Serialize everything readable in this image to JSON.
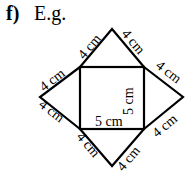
{
  "header": {
    "part_label": "f)",
    "example_label": "E.g."
  },
  "diagram": {
    "square": {
      "width_label": "5 cm",
      "height_label": "5 cm"
    },
    "triangles": {
      "top_left_edge": "4 cm",
      "top_right_edge": "4 cm",
      "right_upper_edge": "4 cm",
      "right_lower_edge": "4 cm",
      "bottom_right_edge": "4 cm",
      "bottom_left_edge": "4 cm",
      "left_lower_edge": "4 cm",
      "left_upper_edge": "4 cm"
    },
    "line_color": "#000000"
  }
}
